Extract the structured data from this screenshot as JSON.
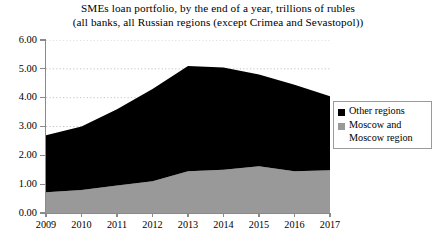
{
  "chart_data": {
    "type": "area",
    "title": "SMEs loan portfolio, by the end of a year, trillions of rubles",
    "subtitle": "(all banks, all Russian regions (except Crimea and Sevastopol))",
    "stacked": true,
    "xlabel": "",
    "ylabel": "",
    "categories": [
      "2009",
      "2010",
      "2011",
      "2012",
      "2013",
      "2014",
      "2015",
      "2016",
      "2017"
    ],
    "ylim": [
      0,
      6
    ],
    "ytick_values": [
      0,
      1,
      2,
      3,
      4,
      5,
      6
    ],
    "ytick_labels": [
      "0.00",
      "1.00",
      "2.00",
      "3.00",
      "4.00",
      "5.00",
      "6.00"
    ],
    "grid": "horizontal-dotted",
    "legend_position": "right",
    "series": [
      {
        "name": "Other regions",
        "color": "#000000",
        "values": [
          1.98,
          2.2,
          2.65,
          3.2,
          3.65,
          3.55,
          3.18,
          3.0,
          2.57
        ]
      },
      {
        "name": "Moscow and\nMoscow region",
        "color": "#999999",
        "values": [
          0.72,
          0.8,
          0.95,
          1.1,
          1.45,
          1.5,
          1.62,
          1.45,
          1.48
        ]
      }
    ],
    "totals": [
      2.7,
      3.0,
      3.6,
      4.3,
      5.1,
      5.05,
      4.8,
      4.45,
      4.05
    ]
  },
  "legend": {
    "items": [
      {
        "label": "Other regions",
        "color": "#000000"
      },
      {
        "label": "Moscow and\nMoscow region",
        "color": "#999999"
      }
    ]
  }
}
